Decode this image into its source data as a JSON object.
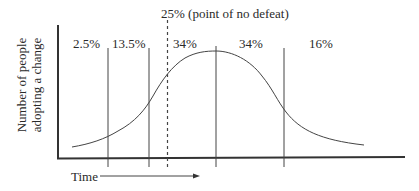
{
  "title": "25% (point of no defeat)",
  "segments": [
    {
      "label": "2.5%"
    },
    {
      "label": "13.5%"
    },
    {
      "label": "34%"
    },
    {
      "label": "34%"
    },
    {
      "label": "16%"
    }
  ],
  "axes": {
    "y_label_line1": "Number of people",
    "y_label_line2": "adopting a change",
    "x_label": "Time"
  },
  "colors": {
    "line": "#333333",
    "background": "#ffffff"
  }
}
